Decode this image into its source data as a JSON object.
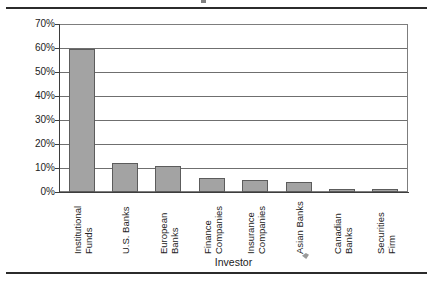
{
  "figure": {
    "background": "#ffffff",
    "bar_fill": "#a3a3a3",
    "bar_border": "#5c5c5c",
    "grid_color": "#6f6f6f",
    "axis_color": "#3d3d3d",
    "rule_color": "#2b2b2b"
  },
  "chart_data": {
    "type": "bar",
    "title": "",
    "xlabel": "Investor",
    "ylabel": "",
    "categories": [
      "Institutional Funds",
      "U.S. Banks",
      "European Banks",
      "Finance Companies",
      "Insurance Companies",
      "Asian Banks",
      "Canadian Banks",
      "Securities Firm"
    ],
    "category_lines": [
      [
        "Institutional",
        "Funds"
      ],
      [
        "U.S. Banks"
      ],
      [
        "European",
        "Banks"
      ],
      [
        "Finance",
        "Companies"
      ],
      [
        "Insurance",
        "Companies"
      ],
      [
        "Asian Banks"
      ],
      [
        "Canadian",
        "Banks"
      ],
      [
        "Securities",
        "Firm"
      ]
    ],
    "values": [
      60,
      12,
      11,
      6,
      5,
      4,
      1,
      1
    ],
    "value_labels": [
      "60%",
      "12%",
      "11%",
      "6%",
      "5%",
      "4%",
      "1%",
      "1%"
    ],
    "ylim": [
      0,
      70
    ],
    "ytick_values": [
      0,
      10,
      20,
      30,
      40,
      50,
      60,
      70
    ],
    "ytick_labels": [
      "0%",
      "10%",
      "20%",
      "30%",
      "40%",
      "50%",
      "60%",
      "70%"
    ],
    "grid": true,
    "grid_axis": "y",
    "legend": false,
    "legend_position": "none",
    "series": [
      {
        "name": "Share of investors",
        "values": [
          60,
          12,
          11,
          6,
          5,
          4,
          1,
          1
        ]
      }
    ]
  }
}
